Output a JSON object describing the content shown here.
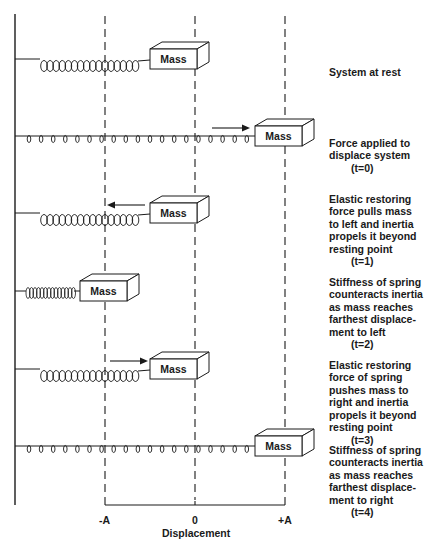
{
  "diagram": {
    "mass_label": "Mass",
    "rows": [
      {
        "id": "rest",
        "caption": "System at rest",
        "time": "",
        "mass_x": 150,
        "y": 59,
        "spring": "tight-long",
        "arrow": "none"
      },
      {
        "id": "t0",
        "caption": "Force applied to\ndisplace system",
        "time": "(t=0)",
        "mass_x": 255,
        "y": 136,
        "spring": "stretched",
        "arrow": "right"
      },
      {
        "id": "t1",
        "caption": "Elastic restoring\nforce pulls mass\nto left and inertia\npropels it beyond\nresting point",
        "time": "(t=1)",
        "mass_x": 150,
        "y": 213,
        "spring": "tight-long",
        "arrow": "left"
      },
      {
        "id": "t2",
        "caption": "Stiffness of spring\ncounteracts inertia\nas mass reaches\nfarthest displace-\nment to left",
        "time": "(t=2)",
        "mass_x": 80,
        "y": 291,
        "spring": "compressed",
        "arrow": "none"
      },
      {
        "id": "t3",
        "caption": "Elastic restoring\nforce of spring\npushes mass to\nright and inertia\npropels it beyond\nresting point",
        "time": "(t=3)",
        "mass_x": 150,
        "y": 369,
        "spring": "tight-long",
        "arrow": "right"
      },
      {
        "id": "t4",
        "caption": "Stiffness of spring\ncounteracts inertia\nas mass reaches\nfarthest displace-\nment to right",
        "time": "(t=4)",
        "mass_x": 255,
        "y": 446,
        "spring": "stretched",
        "arrow": "none"
      }
    ],
    "axis": {
      "label": "Displacement",
      "ticks": [
        {
          "label": "-A",
          "x": 105
        },
        {
          "label": "0",
          "x": 195
        },
        {
          "label": "+A",
          "x": 285
        }
      ]
    },
    "colors": {
      "line": "#1a1a1a",
      "background": "#ffffff"
    }
  }
}
